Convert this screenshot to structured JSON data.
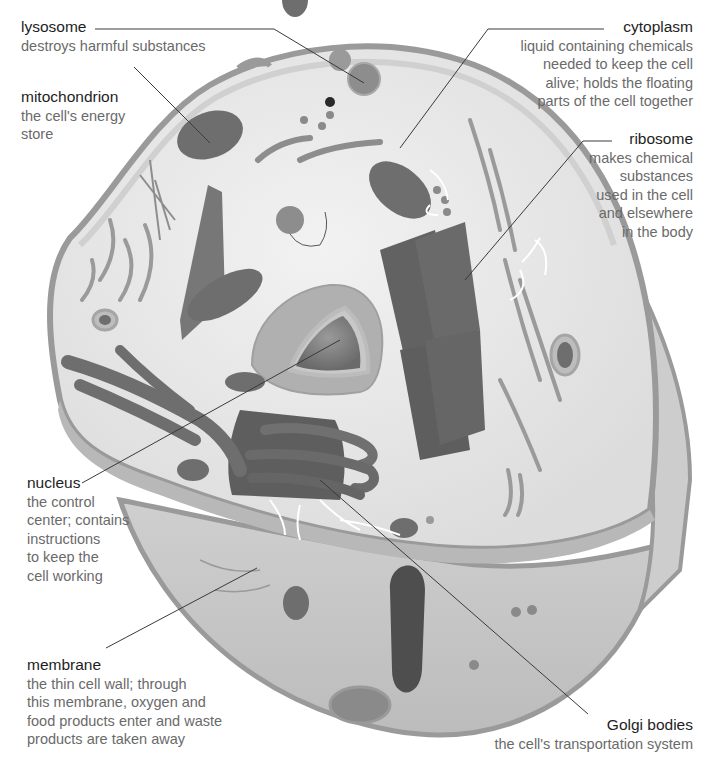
{
  "diagram": {
    "colors": {
      "background": "#ffffff",
      "cytoplasm": "#e4e4e4",
      "membrane_rim": "#9a9a9a",
      "membrane_side": "#c4c4c4",
      "organelle_dark": "#6e6e6e",
      "organelle_mid": "#8d8d8d",
      "leader_line": "#3a3a3a",
      "term_text": "#1e1e1e",
      "desc_text": "#6a6a6a"
    },
    "labels": {
      "lysosome": {
        "term": "lysosome",
        "desc": "destroys harmful substances"
      },
      "mitochondrion": {
        "term": "mitochondrion",
        "desc": "the cell's energy\nstore"
      },
      "cytoplasm": {
        "term": "cytoplasm",
        "desc": "liquid containing chemicals\nneeded to keep the cell\nalive; holds the floating\nparts of the cell together"
      },
      "ribosome": {
        "term": "ribosome",
        "desc": "makes chemical\nsubstances\nused in the cell\nand elsewhere\nin the body"
      },
      "nucleus": {
        "term": "nucleus",
        "desc": "the control\ncenter; contains\ninstructions\nto keep the\ncell working"
      },
      "membrane": {
        "term": "membrane",
        "desc": "the thin cell wall; through\nthis membrane, oxygen and\nfood products enter and waste\nproducts are taken away"
      },
      "golgi": {
        "term": "Golgi bodies",
        "desc": "the cell's transportation system"
      }
    }
  }
}
